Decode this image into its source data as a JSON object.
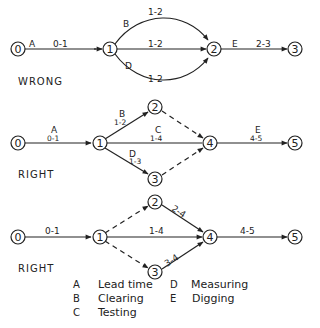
{
  "diagrams": [
    {
      "caption": "WRONG",
      "nodes": [
        "0",
        "1",
        "2",
        "3"
      ],
      "edges": [
        {
          "from": "0",
          "to": "1",
          "activity": "A",
          "label": "0-1",
          "style": "solid"
        },
        {
          "from": "1",
          "to": "2",
          "activity": "B",
          "label": "1-2",
          "style": "solid",
          "curve": "upper"
        },
        {
          "from": "1",
          "to": "2",
          "activity": "",
          "label": "1-2",
          "style": "solid"
        },
        {
          "from": "1",
          "to": "2",
          "activity": "D",
          "label": "1-2",
          "style": "solid",
          "curve": "lower"
        },
        {
          "from": "2",
          "to": "3",
          "activity": "E",
          "label": "2-3",
          "style": "solid"
        }
      ]
    },
    {
      "caption": "RIGHT",
      "nodes": [
        "0",
        "1",
        "2",
        "3",
        "4",
        "5"
      ],
      "edges": [
        {
          "from": "0",
          "to": "1",
          "activity": "A",
          "label": "0-1",
          "style": "solid"
        },
        {
          "from": "1",
          "to": "2",
          "activity": "B",
          "label": "1-2",
          "style": "solid"
        },
        {
          "from": "1",
          "to": "4",
          "activity": "C",
          "label": "1-4",
          "style": "solid"
        },
        {
          "from": "1",
          "to": "3",
          "activity": "D",
          "label": "1-3",
          "style": "solid"
        },
        {
          "from": "2",
          "to": "4",
          "activity": "",
          "label": "",
          "style": "dashed"
        },
        {
          "from": "3",
          "to": "4",
          "activity": "",
          "label": "",
          "style": "dashed"
        },
        {
          "from": "4",
          "to": "5",
          "activity": "E",
          "label": "4-5",
          "style": "solid"
        }
      ]
    },
    {
      "caption": "RIGHT",
      "nodes": [
        "0",
        "1",
        "2",
        "3",
        "4",
        "5"
      ],
      "edges": [
        {
          "from": "0",
          "to": "1",
          "activity": "",
          "label": "0-1",
          "style": "solid"
        },
        {
          "from": "1",
          "to": "2",
          "activity": "",
          "label": "",
          "style": "dashed"
        },
        {
          "from": "1",
          "to": "4",
          "activity": "",
          "label": "1-4",
          "style": "solid"
        },
        {
          "from": "1",
          "to": "3",
          "activity": "",
          "label": "",
          "style": "dashed"
        },
        {
          "from": "2",
          "to": "4",
          "activity": "",
          "label": "2-4",
          "style": "solid"
        },
        {
          "from": "3",
          "to": "4",
          "activity": "",
          "label": "3-4",
          "style": "solid"
        },
        {
          "from": "4",
          "to": "5",
          "activity": "",
          "label": "4-5",
          "style": "solid"
        }
      ]
    }
  ],
  "legend": [
    {
      "key": "A",
      "value": "Lead time"
    },
    {
      "key": "B",
      "value": "Clearing"
    },
    {
      "key": "C",
      "value": "Testing"
    },
    {
      "key": "D",
      "value": "Measuring"
    },
    {
      "key": "E",
      "value": "Digging"
    }
  ]
}
